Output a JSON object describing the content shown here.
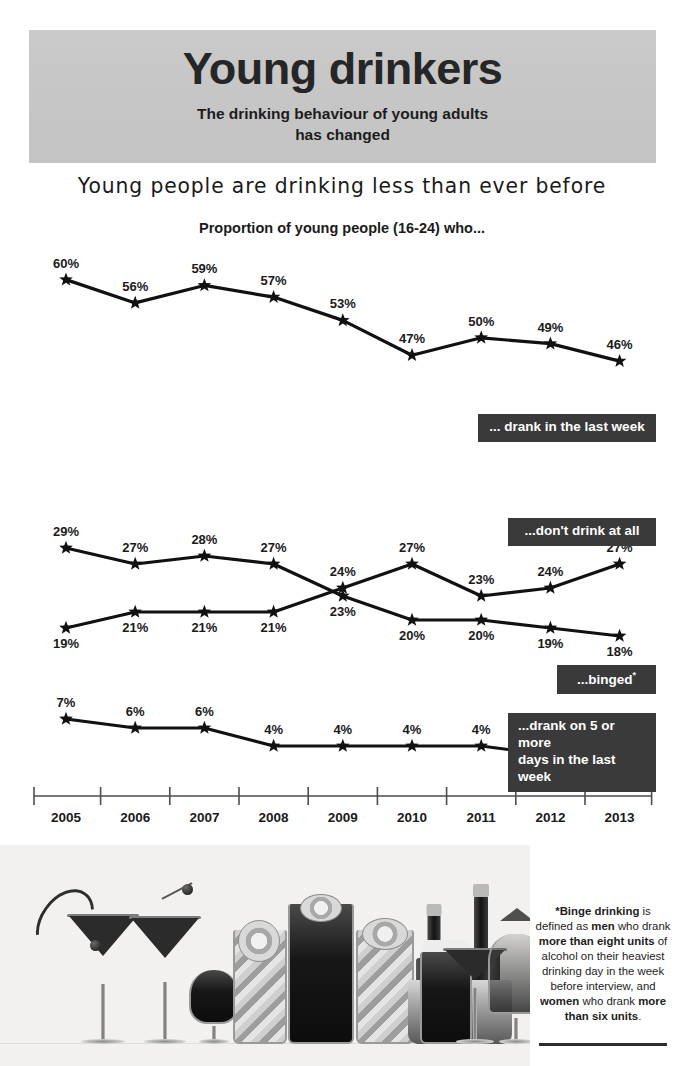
{
  "header": {
    "title": "Young drinkers",
    "subtitle_line1": "The drinking behaviour of young adults",
    "subtitle_line2": "has changed",
    "band_color": "#c6c6c6"
  },
  "strapline": "Young people are drinking less than ever before",
  "chart_title": "Proportion of young people (16-24) who...",
  "callouts": {
    "drank_last_week": "... drank in the last week",
    "dont_drink_at_all": "...don't drink at all",
    "binged": "...binged",
    "binged_marker": "*",
    "five_days_line1": "...drank on 5 or more",
    "five_days_line2": "days in the last week",
    "box_color": "#3a3a3a"
  },
  "footnote": {
    "part1": "*Binge drinking",
    "part2": " is defined as ",
    "bold1": "men",
    "part3": " who drank ",
    "bold2": "more than eight units",
    "part4": " of alcohol on their heaviest drinking day in the week before interview, and ",
    "bold3": "women",
    "part5": " who drank ",
    "bold4": "more than six units",
    "part6": "."
  },
  "photo": {
    "caption": "assorted-cocktails-and-bottles-photograph"
  },
  "chart_data": {
    "type": "line",
    "title": "Proportion of young people (16-24) who...",
    "xlabel": "",
    "ylabel": "Percentage",
    "categories": [
      "2005",
      "2006",
      "2007",
      "2008",
      "2009",
      "2010",
      "2011",
      "2012",
      "2013"
    ],
    "grid": false,
    "legend_position": "inline-right-labels",
    "value_suffix": "%",
    "panels": [
      {
        "name": "drank-in-last-week",
        "label": "... drank in the last week",
        "ylim": [
          40,
          62
        ],
        "series": [
          {
            "name": "... drank in the last week",
            "values": [
              60,
              56,
              59,
              57,
              53,
              47,
              50,
              49,
              46
            ],
            "labels": [
              "60%",
              "56%",
              "59%",
              "57%",
              "53%",
              "47%",
              "50%",
              "49%",
              "46%"
            ]
          }
        ]
      },
      {
        "name": "dont-drink-and-binged",
        "label": "...don't drink at all / ...binged*",
        "ylim": [
          16,
          31
        ],
        "series": [
          {
            "name": "...binged*",
            "values": [
              29,
              27,
              28,
              27,
              23,
              20,
              20,
              19,
              18
            ],
            "labels": [
              "29%",
              "27%",
              "28%",
              "27%",
              "23%",
              "20%",
              "20%",
              "19%",
              "18%"
            ]
          },
          {
            "name": "...don't drink at all",
            "values": [
              19,
              21,
              21,
              21,
              24,
              27,
              23,
              24,
              27
            ],
            "labels": [
              "19%",
              "21%",
              "21%",
              "21%",
              "24%",
              "27%",
              "23%",
              "24%",
              "27%"
            ]
          }
        ]
      },
      {
        "name": "drank-five-or-more-days",
        "label": "...drank on 5 or more days in the last week",
        "ylim": [
          0,
          8
        ],
        "series": [
          {
            "name": "...drank on 5 or more days in the last week",
            "values": [
              7,
              6,
              6,
              4,
              4,
              4,
              4,
              3,
              2
            ],
            "labels": [
              "7%",
              "6%",
              "6%",
              "4%",
              "4%",
              "4%",
              "4%",
              "3%",
              "2%"
            ]
          }
        ]
      }
    ]
  }
}
